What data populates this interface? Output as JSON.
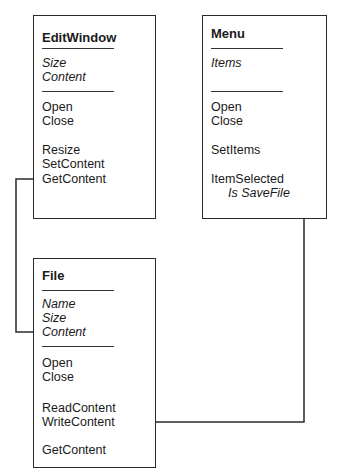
{
  "classes": [
    {
      "id": "editwindow",
      "name": "EditWindow",
      "attributes": [
        "Size",
        "Content"
      ],
      "method_groups": [
        [
          "Open",
          "Close"
        ],
        [
          "Resize",
          "SetContent",
          "GetContent"
        ]
      ]
    },
    {
      "id": "menu",
      "name": "Menu",
      "attributes": [
        "Items"
      ],
      "method_groups": [
        [
          "Open",
          "Close"
        ],
        [
          "SetItems"
        ],
        [
          "ItemSelected"
        ]
      ],
      "annotation": "Is SaveFile"
    },
    {
      "id": "file",
      "name": "File",
      "attributes": [
        "Name",
        "Size",
        "Content"
      ],
      "method_groups": [
        [
          "Open",
          "Close"
        ],
        [
          "ReadContent",
          "WriteContent"
        ],
        [
          "GetContent"
        ]
      ]
    }
  ],
  "connections": [
    {
      "from": "EditWindow.GetContent",
      "to": "File.Content"
    },
    {
      "from": "Menu.ItemSelected (Is SaveFile)",
      "to": "File.WriteContent"
    }
  ],
  "colors": {
    "line": "#2a2a2a",
    "text": "#1a1a1a",
    "background": "#ffffff"
  }
}
